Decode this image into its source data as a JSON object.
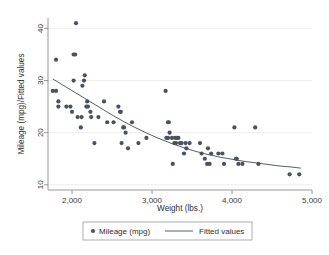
{
  "chart_data": {
    "type": "scatter",
    "title": "",
    "xlabel": "Weight (lbs.)",
    "ylabel": "Mileage (mpg)/Fitted values",
    "xlim": [
      1700,
      5000
    ],
    "ylim": [
      9,
      42
    ],
    "xticks": [
      2000,
      3000,
      4000,
      5000
    ],
    "xtick_labels": [
      "2,000",
      "3,000",
      "4,000",
      "5,000"
    ],
    "yticks": [
      10,
      20,
      30,
      40
    ],
    "ytick_labels": [
      "10",
      "20",
      "30",
      "40"
    ],
    "grid": "horizontal",
    "legend_position": "bottom",
    "legend": [
      {
        "label": "Mileage (mpg)",
        "marker": "circle",
        "color": "#4a5260"
      },
      {
        "label": "Fitted values",
        "marker": "line",
        "color": "#555f6e"
      }
    ],
    "series": [
      {
        "name": "Mileage (mpg)",
        "type": "scatter",
        "color": "#4a5260",
        "points": [
          [
            1760,
            28
          ],
          [
            1800,
            28
          ],
          [
            1800,
            34
          ],
          [
            1830,
            26
          ],
          [
            1830,
            25
          ],
          [
            1930,
            25
          ],
          [
            1980,
            25
          ],
          [
            2000,
            24
          ],
          [
            2020,
            30
          ],
          [
            2020,
            35
          ],
          [
            2040,
            35
          ],
          [
            2050,
            41
          ],
          [
            2070,
            23
          ],
          [
            2110,
            21
          ],
          [
            2120,
            23
          ],
          [
            2130,
            29
          ],
          [
            2150,
            30
          ],
          [
            2160,
            31
          ],
          [
            2180,
            25
          ],
          [
            2190,
            26
          ],
          [
            2200,
            25
          ],
          [
            2230,
            24
          ],
          [
            2240,
            23
          ],
          [
            2280,
            18
          ],
          [
            2330,
            23
          ],
          [
            2400,
            26
          ],
          [
            2440,
            22
          ],
          [
            2520,
            22
          ],
          [
            2580,
            25
          ],
          [
            2600,
            24
          ],
          [
            2610,
            24
          ],
          [
            2620,
            18
          ],
          [
            2640,
            21
          ],
          [
            2650,
            21
          ],
          [
            2670,
            20
          ],
          [
            2700,
            17
          ],
          [
            2750,
            22
          ],
          [
            2830,
            18
          ],
          [
            2930,
            19
          ],
          [
            3170,
            28
          ],
          [
            3180,
            19
          ],
          [
            3200,
            19
          ],
          [
            3200,
            22
          ],
          [
            3210,
            22
          ],
          [
            3220,
            20
          ],
          [
            3250,
            19
          ],
          [
            3260,
            14
          ],
          [
            3280,
            18
          ],
          [
            3290,
            19
          ],
          [
            3300,
            18
          ],
          [
            3310,
            19
          ],
          [
            3330,
            19
          ],
          [
            3350,
            18
          ],
          [
            3360,
            18
          ],
          [
            3370,
            18
          ],
          [
            3400,
            16
          ],
          [
            3420,
            18
          ],
          [
            3430,
            17
          ],
          [
            3470,
            18
          ],
          [
            3600,
            18
          ],
          [
            3620,
            16
          ],
          [
            3660,
            15
          ],
          [
            3690,
            14
          ],
          [
            3700,
            17
          ],
          [
            3720,
            14
          ],
          [
            3740,
            16
          ],
          [
            3830,
            16
          ],
          [
            3880,
            16
          ],
          [
            3900,
            14
          ],
          [
            4030,
            21
          ],
          [
            4050,
            15
          ],
          [
            4060,
            15
          ],
          [
            4080,
            14
          ],
          [
            4130,
            14
          ],
          [
            4290,
            21
          ],
          [
            4330,
            14
          ],
          [
            4720,
            12
          ],
          [
            4840,
            12
          ]
        ]
      },
      {
        "name": "Fitted values",
        "type": "line",
        "color": "#555f6e",
        "points": [
          [
            1760,
            30.3
          ],
          [
            1900,
            29.0
          ],
          [
            2050,
            27.6
          ],
          [
            2200,
            26.2
          ],
          [
            2350,
            24.8
          ],
          [
            2500,
            23.4
          ],
          [
            2650,
            22.1
          ],
          [
            2800,
            20.9
          ],
          [
            2950,
            19.8
          ],
          [
            3100,
            18.8
          ],
          [
            3250,
            17.9
          ],
          [
            3400,
            17.1
          ],
          [
            3550,
            16.4
          ],
          [
            3700,
            15.8
          ],
          [
            3850,
            15.3
          ],
          [
            4000,
            14.9
          ],
          [
            4150,
            14.5
          ],
          [
            4300,
            14.2
          ],
          [
            4450,
            13.9
          ],
          [
            4600,
            13.6
          ],
          [
            4750,
            13.4
          ],
          [
            4860,
            13.2
          ]
        ]
      }
    ]
  }
}
